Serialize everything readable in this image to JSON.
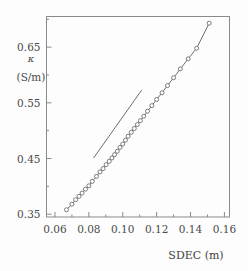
{
  "figure": {
    "background": "#fdfdfd",
    "frame_color": "#8a8a8a",
    "data_color": "#6e6e6e",
    "marker_fill": "#ffffff"
  },
  "axes": {
    "y_symbol": "κ",
    "y_unit": "(S/m)",
    "x_title": "SDEC (m)",
    "y_ticklabels": [
      "0.65",
      "0.55",
      "0.45",
      "0.35"
    ],
    "x_ticklabels": [
      "0.06",
      "0.08",
      "0.10",
      "0.12",
      "0.14",
      "0.16"
    ]
  },
  "chart_data": {
    "type": "scatter",
    "title": "",
    "xlabel": "SDEC (m)",
    "ylabel": "κ (S/m)",
    "xlim": [
      0.055,
      0.163
    ],
    "ylim": [
      0.345,
      0.705
    ],
    "xticks": [
      0.06,
      0.08,
      0.1,
      0.12,
      0.14,
      0.16
    ],
    "yticks": [
      0.35,
      0.45,
      0.55,
      0.65
    ],
    "x_minor_ticks": [
      0.07,
      0.09,
      0.11,
      0.13,
      0.15
    ],
    "y_minor_ticks": [
      0.4,
      0.5,
      0.6,
      0.7
    ],
    "grid": false,
    "legend": "none",
    "series": [
      {
        "name": "measured kappa vs SDEC",
        "marker": "open-circle",
        "line": "solid",
        "x": [
          0.0668,
          0.07,
          0.0722,
          0.0742,
          0.076,
          0.078,
          0.08,
          0.082,
          0.0845,
          0.0866,
          0.0884,
          0.0902,
          0.092,
          0.0936,
          0.0952,
          0.0968,
          0.0984,
          0.1,
          0.1016,
          0.1032,
          0.105,
          0.1068,
          0.1086,
          0.1104,
          0.1124,
          0.1146,
          0.1172,
          0.12,
          0.1232,
          0.1264,
          0.13,
          0.134,
          0.1386,
          0.1436,
          0.151
        ],
        "y": [
          0.358,
          0.368,
          0.376,
          0.382,
          0.388,
          0.395,
          0.401,
          0.409,
          0.418,
          0.426,
          0.432,
          0.439,
          0.445,
          0.451,
          0.457,
          0.463,
          0.47,
          0.476,
          0.483,
          0.49,
          0.497,
          0.504,
          0.511,
          0.518,
          0.526,
          0.535,
          0.545,
          0.556,
          0.568,
          0.581,
          0.595,
          0.611,
          0.629,
          0.648,
          0.693
        ]
      },
      {
        "name": "reference trend line",
        "marker": "none",
        "line": "solid",
        "x": [
          0.0828,
          0.1112
        ],
        "y": [
          0.451,
          0.573
        ]
      }
    ]
  }
}
